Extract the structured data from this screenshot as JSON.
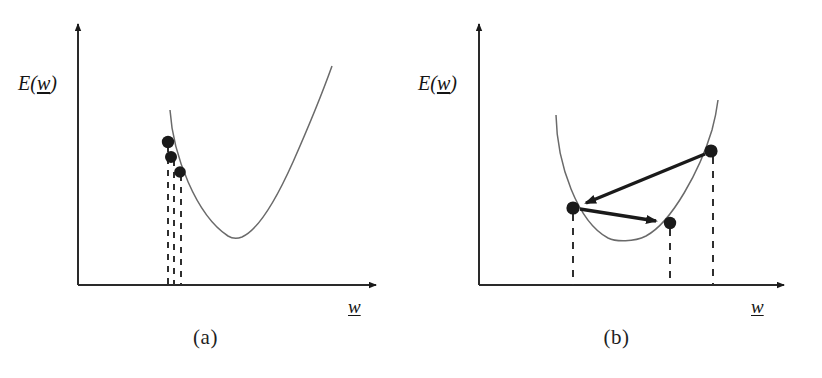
{
  "figure": {
    "width": 822,
    "height": 378,
    "background": "#ffffff",
    "ink_color": "#1a1a1a",
    "curve_color": "#555555",
    "dot_color": "#1a1a1a",
    "dashed_color": "#333333"
  },
  "panels": [
    {
      "id": "a",
      "caption": "(a)",
      "y_axis_label": "E(",
      "y_axis_label_vector": "w",
      "y_axis_label_tail": ")",
      "x_axis_label_vector": "w",
      "description": "small learning rate, slow descent along steep wall",
      "axes": {
        "origin": [
          78,
          285
        ],
        "y_tip": [
          78,
          18
        ],
        "x_tip": [
          382,
          285
        ]
      },
      "curve": {
        "type": "parabola",
        "left_top": [
          170,
          110
        ],
        "minimum": [
          240,
          238
        ],
        "right_top": [
          332,
          66
        ]
      },
      "points": [
        {
          "label": "w0",
          "x": 168,
          "y": 142
        },
        {
          "label": "w1",
          "x": 170,
          "y": 157
        },
        {
          "label": "w2",
          "x": 179,
          "y": 172
        }
      ],
      "dashed_drop_lines_x": [
        168,
        173,
        180
      ],
      "arrows": []
    },
    {
      "id": "b",
      "caption": "(b)",
      "y_axis_label": "E(",
      "y_axis_label_vector": "w",
      "y_axis_label_tail": ")",
      "x_axis_label_vector": "w",
      "description": "large learning rate, oscillating overshoot across the valley",
      "axes": {
        "origin": [
          479,
          285
        ],
        "y_tip": [
          479,
          18
        ],
        "x_tip": [
          790,
          285
        ]
      },
      "curve": {
        "type": "parabola",
        "left_top": [
          556,
          115
        ],
        "minimum": [
          628,
          240
        ],
        "right_top": [
          718,
          100
        ]
      },
      "points": [
        {
          "label": "w0",
          "x": 711,
          "y": 151
        },
        {
          "label": "w1",
          "x": 573,
          "y": 208
        },
        {
          "label": "w2",
          "x": 670,
          "y": 223
        }
      ],
      "dashed_drop_lines_x": [
        573,
        670,
        713
      ],
      "arrows": [
        {
          "from": [
            711,
            151
          ],
          "to": [
            573,
            208
          ],
          "head": "to"
        },
        {
          "from": [
            573,
            208
          ],
          "to": [
            670,
            223
          ],
          "head": "to"
        }
      ]
    }
  ]
}
